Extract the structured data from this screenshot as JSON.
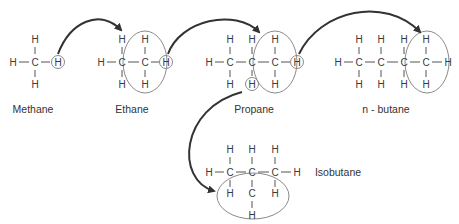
{
  "diagram": {
    "type": "alkane-substitution-series",
    "colors": {
      "text": "#3a3a3a",
      "bond": "#555555",
      "ellipse": "#8a8a8a",
      "arrow": "#333333",
      "background": "#ffffff"
    },
    "atom_symbols": {
      "carbon": "C",
      "hydrogen": "H"
    },
    "molecules": [
      {
        "id": "methane",
        "label": "Methane",
        "carbons": 1,
        "highlighted_hydrogens": 1,
        "highlighted_group": null
      },
      {
        "id": "ethane",
        "label": "Ethane",
        "carbons": 2,
        "highlighted_hydrogens": 1,
        "highlighted_group": "CH3 (added methyl)"
      },
      {
        "id": "propane",
        "label": "Propane",
        "carbons": 3,
        "highlighted_hydrogens": 2,
        "highlighted_group": "CH3 (added methyl)"
      },
      {
        "id": "n-butane",
        "label": "n - butane",
        "carbons": 4,
        "highlighted_hydrogens": 0,
        "highlighted_group": "CH3 (added methyl)"
      },
      {
        "id": "isobutane",
        "label": "Isobutane",
        "carbons": 4,
        "highlighted_hydrogens": 0,
        "highlighted_group": "CH3 branch (added methyl)"
      }
    ],
    "arrows": [
      {
        "from": "methane",
        "to": "ethane"
      },
      {
        "from": "ethane",
        "to": "propane"
      },
      {
        "from": "propane",
        "to": "n-butane"
      },
      {
        "from": "propane",
        "to": "isobutane"
      }
    ]
  }
}
